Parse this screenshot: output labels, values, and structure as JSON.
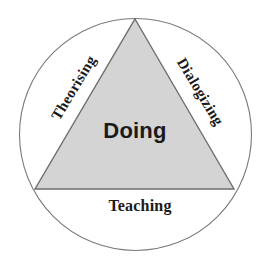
{
  "figure": {
    "type": "venn-triangle-in-circle",
    "background_color": "#ffffff"
  },
  "shapes": {
    "circle": {
      "name": "outer-circle",
      "center_x": 135.5,
      "center_y": 134.5,
      "radius": 116,
      "fill_color": "#ffffff",
      "stroke_color": "#7a7a7a",
      "stroke_width": 1.1
    },
    "triangle": {
      "name": "inner-triangle",
      "points": "135,19 234,189 35,189",
      "apex_x": 135,
      "apex_y": 19,
      "bottom_left_x": 35,
      "bottom_left_y": 189,
      "bottom_right_x": 234,
      "bottom_right_y": 189,
      "fill_color": "#d4d4d4",
      "stroke_color": "#6e6e6e",
      "stroke_width": 1.4
    }
  },
  "labels": {
    "center": "Doing",
    "bottom": "Teaching",
    "left_edge": "Theorising",
    "right_edge": "Dialogizing"
  },
  "colors": {
    "text": "#1a1a1a",
    "triangle_fill": "#d4d4d4",
    "line": "#6e6e6e",
    "page_background": "#ffffff"
  }
}
